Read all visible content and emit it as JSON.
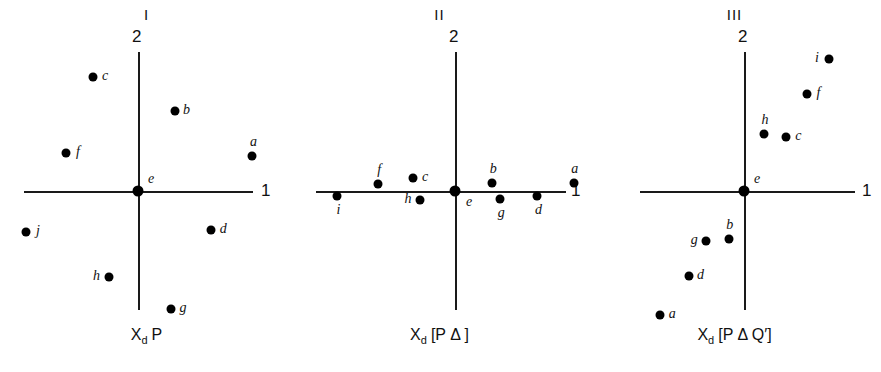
{
  "figure": {
    "background": "#ffffff",
    "point_color": "#000000",
    "axis_color": "#1a1a1a"
  },
  "chart_data": {
    "type": "scatter",
    "title": "",
    "panel_count": 3,
    "xlabel": "1",
    "ylabel": "2",
    "grid": false,
    "legend": null,
    "axis_note": "Each panel shows two crossing axes labelled 1 (horizontal) and 2 (vertical); the origin is the point e.",
    "panels": [
      {
        "id": "panel-1",
        "numeral": "I",
        "caption_parts": {
          "x": "X",
          "sub": "d",
          "rest": "P"
        },
        "caption_text": "XdP",
        "xlabel": "1",
        "ylabel": "2",
        "points": [
          {
            "label": "c",
            "x": -0.38,
            "y": 0.97,
            "label_pos": "right"
          },
          {
            "label": "b",
            "x": 0.31,
            "y": 0.68,
            "label_pos": "right"
          },
          {
            "label": "a",
            "x": 0.97,
            "y": 0.3,
            "label_pos": "above"
          },
          {
            "label": "f",
            "x": -0.61,
            "y": 0.32,
            "label_pos": "right"
          },
          {
            "label": "e",
            "x": 0.0,
            "y": 0.0,
            "label_pos": "above-right"
          },
          {
            "label": "j",
            "x": -0.95,
            "y": -0.35,
            "label_pos": "right"
          },
          {
            "label": "d",
            "x": 0.62,
            "y": -0.33,
            "label_pos": "right"
          },
          {
            "label": "h",
            "x": -0.25,
            "y": -0.73,
            "label_pos": "left"
          },
          {
            "label": "g",
            "x": 0.28,
            "y": -1.0,
            "label_pos": "right"
          }
        ]
      },
      {
        "id": "panel-2",
        "numeral": "II",
        "caption_parts": {
          "x": "X",
          "sub": "d",
          "rest": "[P Δ ]"
        },
        "caption_text": "Xd [PΔ]",
        "xlabel": "1",
        "ylabel": "2",
        "points": [
          {
            "label": "i",
            "x": -1.04,
            "y": -0.04,
            "label_pos": "below"
          },
          {
            "label": "f",
            "x": -0.68,
            "y": 0.06,
            "label_pos": "above"
          },
          {
            "label": "c",
            "x": -0.37,
            "y": 0.11,
            "label_pos": "right"
          },
          {
            "label": "h",
            "x": -0.31,
            "y": -0.08,
            "label_pos": "left"
          },
          {
            "label": "e",
            "x": 0.0,
            "y": 0.0,
            "label_pos": "below-right"
          },
          {
            "label": "b",
            "x": 0.33,
            "y": 0.07,
            "label_pos": "above"
          },
          {
            "label": "g",
            "x": 0.4,
            "y": -0.07,
            "label_pos": "below"
          },
          {
            "label": "d",
            "x": 0.73,
            "y": -0.04,
            "label_pos": "below"
          },
          {
            "label": "a",
            "x": 1.05,
            "y": 0.07,
            "label_pos": "above"
          }
        ]
      },
      {
        "id": "panel-3",
        "numeral": "III",
        "caption_parts": {
          "x": "X",
          "sub": "d",
          "rest": "[P Δ Q′]"
        },
        "caption_text": "Xd [PΔQ′]",
        "xlabel": "1",
        "ylabel": "2",
        "points": [
          {
            "label": "i",
            "x": 0.72,
            "y": 1.12,
            "label_pos": "left"
          },
          {
            "label": "f",
            "x": 0.53,
            "y": 0.82,
            "label_pos": "right"
          },
          {
            "label": "h",
            "x": 0.17,
            "y": 0.48,
            "label_pos": "above"
          },
          {
            "label": "c",
            "x": 0.36,
            "y": 0.46,
            "label_pos": "right"
          },
          {
            "label": "e",
            "x": 0.0,
            "y": 0.0,
            "label_pos": "above-right"
          },
          {
            "label": "b",
            "x": -0.13,
            "y": -0.41,
            "label_pos": "above"
          },
          {
            "label": "g",
            "x": -0.32,
            "y": -0.42,
            "label_pos": "left"
          },
          {
            "label": "d",
            "x": -0.47,
            "y": -0.72,
            "label_pos": "right"
          },
          {
            "label": "a",
            "x": -0.71,
            "y": -1.05,
            "label_pos": "right"
          }
        ]
      }
    ]
  }
}
